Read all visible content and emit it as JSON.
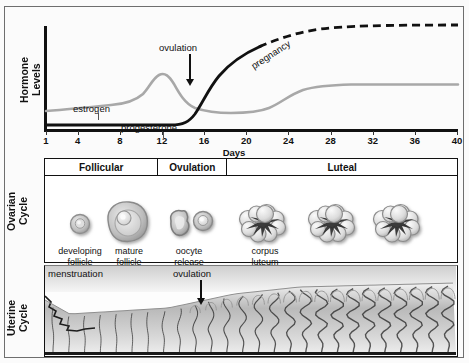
{
  "chart": {
    "y_axis_title": "Hormone\nLevels",
    "x_axis_title": "Days",
    "x_ticks": [
      1,
      4,
      8,
      12,
      16,
      20,
      24,
      28,
      32,
      36,
      40
    ],
    "annotations": {
      "ovulation": "ovulation",
      "estrogen": "estrogen",
      "progesterone": "progesterone",
      "pregnancy": "pregnancy"
    }
  },
  "chart_data": {
    "type": "line",
    "title": "Hormone Levels",
    "xlabel": "Days",
    "ylabel": "Hormone Levels",
    "xlim": [
      1,
      40
    ],
    "ylim": [
      0,
      100
    ],
    "grid": false,
    "legend": "inline-labels",
    "x_ticks": [
      1,
      4,
      8,
      12,
      16,
      20,
      24,
      28,
      32,
      36,
      40
    ],
    "series": [
      {
        "name": "estrogen",
        "style": "solid",
        "color": "#a8a8a8",
        "x": [
          1,
          4,
          8,
          10,
          11,
          12,
          13,
          14,
          15,
          16,
          17,
          18,
          20,
          22,
          24,
          26,
          27,
          28,
          30,
          32,
          36,
          40
        ],
        "values": [
          22,
          23,
          25,
          27,
          31,
          40,
          52,
          58,
          52,
          38,
          27,
          22,
          19,
          18,
          19,
          25,
          31,
          38,
          45,
          48,
          49,
          49
        ]
      },
      {
        "name": "progesterone",
        "style": "solid",
        "color": "#111111",
        "x": [
          1,
          4,
          8,
          12,
          14,
          15,
          16,
          17,
          18,
          19,
          20,
          21,
          22,
          23,
          24
        ],
        "values": [
          4,
          4,
          4,
          4,
          4,
          5,
          9,
          17,
          27,
          37,
          47,
          56,
          64,
          70,
          75
        ]
      },
      {
        "name": "pregnancy",
        "style": "dashed",
        "color": "#111111",
        "x": [
          24,
          26,
          28,
          30,
          32,
          34,
          36,
          38,
          40
        ],
        "values": [
          75,
          82,
          88,
          92,
          94,
          95,
          95,
          95,
          95
        ]
      }
    ]
  },
  "ovarian": {
    "side_label": "Ovarian\nCycle",
    "phases": [
      {
        "label": "Follicular",
        "width_pct": 27.3
      },
      {
        "label": "Ovulation",
        "width_pct": 16.7
      },
      {
        "label": "Luteal",
        "width_pct": 56.0
      }
    ],
    "stages": [
      {
        "name": "developing-follicle",
        "caption": "developing\nfollicle"
      },
      {
        "name": "mature-follicle",
        "caption": "mature\nfollicle"
      },
      {
        "name": "oocyte-release",
        "caption": "oocyte\nrelease"
      },
      {
        "name": "corpus-luteum",
        "caption": "corpus\nluteum"
      },
      {
        "name": "corpus-luteum-2",
        "caption": ""
      },
      {
        "name": "corpus-luteum-3",
        "caption": ""
      }
    ]
  },
  "uterine": {
    "side_label": "Uterine\nCycle",
    "annotations": {
      "menstruation": "menstruation",
      "ovulation": "ovulation"
    }
  },
  "colors": {
    "ink": "#111111",
    "estrogen_gray": "#a8a8a8",
    "panel_border": "#111111",
    "frame": "#6e6e6e",
    "tissue_gray": "#8d8d8d"
  }
}
